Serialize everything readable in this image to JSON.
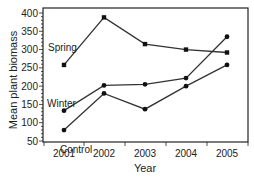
{
  "chart_data": {
    "type": "line",
    "title": "",
    "xlabel": "Year",
    "ylabel": "Mean plant biomass",
    "categories": [
      "2001",
      "2002",
      "2003",
      "2004",
      "2005"
    ],
    "ylim": [
      50,
      400
    ],
    "yticks": [
      50,
      100,
      150,
      200,
      250,
      300,
      350,
      400
    ],
    "grid": false,
    "legend": "inline labels",
    "series": [
      {
        "name": "Spring",
        "marker": "square",
        "values": [
          258,
          388,
          315,
          300,
          292
        ]
      },
      {
        "name": "Winter",
        "marker": "circle",
        "values": [
          133,
          202,
          205,
          222,
          335
        ]
      },
      {
        "name": "Control",
        "marker": "circle",
        "values": [
          80,
          180,
          137,
          200,
          258
        ]
      }
    ]
  },
  "colors": {
    "line": "#333333",
    "axis": "#222222",
    "background": "#ffffff"
  }
}
